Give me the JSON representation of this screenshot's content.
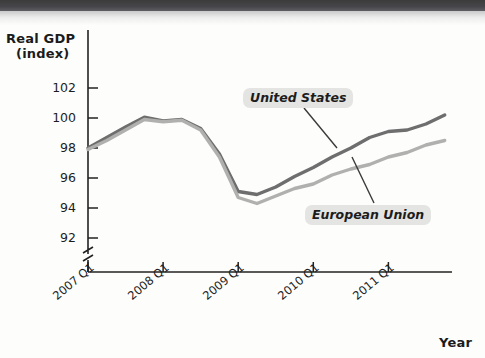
{
  "chart_data": {
    "type": "line",
    "title": "",
    "xlabel": "Year",
    "ylabel": "Real GDP (index)",
    "ylim": [
      91,
      103
    ],
    "yticks": [
      92,
      94,
      96,
      98,
      100,
      102
    ],
    "ytick_labels": [
      "92",
      "94",
      "96",
      "98",
      "100",
      "102"
    ],
    "axis_break": true,
    "grid": false,
    "legend_position": "inline-callout",
    "categories": [
      "2007 Q1",
      "2007 Q2",
      "2007 Q3",
      "2007 Q4",
      "2008 Q1",
      "2008 Q2",
      "2008 Q3",
      "2008 Q4",
      "2009 Q1",
      "2009 Q2",
      "2009 Q3",
      "2009 Q4",
      "2010 Q1",
      "2010 Q2",
      "2010 Q3",
      "2010 Q4",
      "2011 Q1",
      "2011 Q2",
      "2011 Q3",
      "2011 Q4"
    ],
    "xtick_labels": [
      "2007 Q1",
      "2008 Q1",
      "2009 Q1",
      "2010 Q1",
      "2011 Q1"
    ],
    "xtick_indices": [
      0,
      4,
      8,
      12,
      16
    ],
    "series": [
      {
        "name": "United States",
        "color": "#6e6e6e",
        "values": [
          98.0,
          98.7,
          99.4,
          100.05,
          99.8,
          99.9,
          99.3,
          97.6,
          95.1,
          94.9,
          95.4,
          96.1,
          96.7,
          97.4,
          98.0,
          98.7,
          99.1,
          99.2,
          99.6,
          100.2
        ]
      },
      {
        "name": "European Union",
        "color": "#b0b0ae",
        "values": [
          97.9,
          98.5,
          99.2,
          99.9,
          99.75,
          99.85,
          99.2,
          97.4,
          94.7,
          94.3,
          94.8,
          95.3,
          95.6,
          96.2,
          96.6,
          96.9,
          97.4,
          97.7,
          98.2,
          98.5
        ]
      }
    ]
  },
  "axes": {
    "y_title_line1": "Real GDP",
    "y_title_line2": "(index)",
    "x_title": "Year"
  },
  "labels": {
    "united_states": "United States",
    "european_union": "European Union"
  }
}
